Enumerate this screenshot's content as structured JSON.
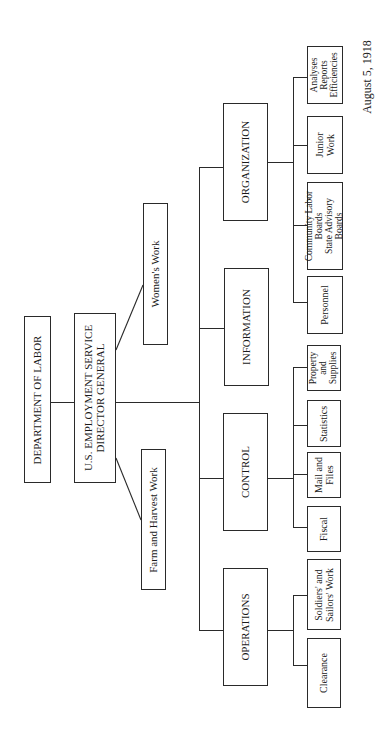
{
  "chart_title_root": "DEPARTMENT OF LABOR",
  "director": {
    "line1": "U.S. EMPLOYMENT SERVICE",
    "line2": "DIRECTOR GENERAL"
  },
  "staff": {
    "womens_work": "Women's Work",
    "farm_harvest": "Farm and Harvest Work"
  },
  "divisions": {
    "organization": {
      "label": "ORGANIZATION",
      "children": [
        {
          "lines": [
            "Analyses",
            "Reports",
            "Efficiencies"
          ]
        },
        {
          "lines": [
            "Junior",
            "Work"
          ]
        },
        {
          "lines": [
            "Community Labor",
            "Boards",
            "State Advisory",
            "Boards"
          ]
        },
        {
          "lines": [
            "Personnel"
          ]
        }
      ]
    },
    "information": {
      "label": "INFORMATION",
      "children": []
    },
    "control": {
      "label": "CONTROL",
      "children": [
        {
          "lines": [
            "Property",
            "and",
            "Supplies"
          ]
        },
        {
          "lines": [
            "Statistics"
          ]
        },
        {
          "lines": [
            "Mail and",
            "Files"
          ]
        },
        {
          "lines": [
            "Fiscal"
          ]
        }
      ]
    },
    "operations": {
      "label": "OPERATIONS",
      "children": [
        {
          "lines": [
            "Soldiers' and",
            "Sailors' Work"
          ]
        },
        {
          "lines": [
            "Clearance"
          ]
        }
      ]
    }
  },
  "date": "August 5, 1918",
  "colors": {
    "line": "#2a2a2a",
    "background": "#ffffff",
    "text": "#1a1a1a"
  }
}
